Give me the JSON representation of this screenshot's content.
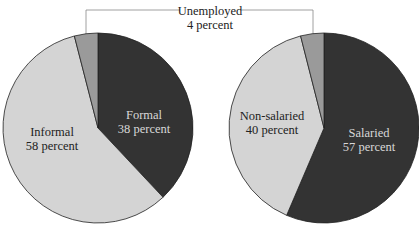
{
  "chart_data": [
    {
      "type": "pie",
      "title": "",
      "categories": [
        "Formal",
        "Informal",
        "Unemployed"
      ],
      "values": [
        38,
        58,
        4
      ],
      "unit": "percent",
      "colors": [
        "#333333",
        "#d4d4d4",
        "#9a9a9a"
      ],
      "labels": [
        {
          "name": "Formal",
          "value": "38 percent"
        },
        {
          "name": "Informal",
          "value": "58 percent"
        },
        {
          "name": "Unemployed",
          "value": "4 percent"
        }
      ]
    },
    {
      "type": "pie",
      "title": "",
      "categories": [
        "Salaried",
        "Non-salaried",
        "Unemployed"
      ],
      "values": [
        57,
        40,
        4
      ],
      "unit": "percent",
      "colors": [
        "#333333",
        "#d4d4d4",
        "#9a9a9a"
      ],
      "labels": [
        {
          "name": "Salaried",
          "value": "57 percent"
        },
        {
          "name": "Non-salaried",
          "value": "40 percent"
        },
        {
          "name": "Unemployed",
          "value": "4 percent"
        }
      ]
    }
  ],
  "callout": {
    "name": "Unemployed",
    "value": "4 percent"
  }
}
